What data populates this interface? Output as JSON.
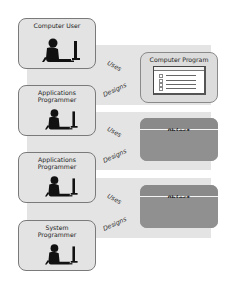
{
  "diagram": {
    "actors": [
      {
        "id": "computer-user",
        "label_lines": [
          "Computer User"
        ]
      },
      {
        "id": "applications-programmer-1",
        "label_lines": [
          "Applications",
          "Programmer"
        ]
      },
      {
        "id": "applications-programmer-2",
        "label_lines": [
          "Applications",
          "Programmer"
        ]
      },
      {
        "id": "system-programmer",
        "label_lines": [
          "System",
          "Programmer"
        ]
      }
    ],
    "relations": [
      {
        "label": "Uses"
      },
      {
        "label": "Designs"
      },
      {
        "label": "Uses"
      },
      {
        "label": "Designs"
      },
      {
        "label": "Uses"
      },
      {
        "label": "Designs"
      }
    ],
    "targets": [
      {
        "id": "computer-program",
        "label": "Computer Program",
        "icon": "window-list-icon"
      },
      {
        "id": "object-1",
        "label": "Object"
      },
      {
        "id": "object-2",
        "label": "Object"
      }
    ],
    "colors": {
      "band": "#e4e4e4",
      "actor_box": "#e3e3e3",
      "object_box": "#8f8f8f",
      "program_box": "#dcdcdc",
      "border": "#7a7a7a"
    }
  }
}
